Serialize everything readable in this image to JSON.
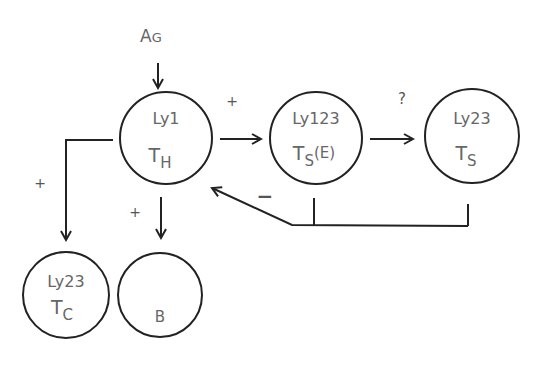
{
  "diagram": {
    "input": {
      "label": "AG",
      "label_main": "A",
      "label_small": "G"
    },
    "nodes": [
      {
        "id": "th",
        "line1": "Ly1",
        "line2_main": "T",
        "line2_sub": "H",
        "cx": 166,
        "cy": 138,
        "r": 46
      },
      {
        "id": "tse",
        "line1": "Ly123",
        "line2_main": "T",
        "line2_sub": "S",
        "line2_suffix": "(E)",
        "cx": 316,
        "cy": 138,
        "r": 46
      },
      {
        "id": "ts",
        "line1": "Ly23",
        "line2_main": "T",
        "line2_sub": "S",
        "cx": 472,
        "cy": 136,
        "r": 47
      },
      {
        "id": "tc",
        "line1": "Ly23",
        "line2_main": "T",
        "line2_sub": "C",
        "cx": 66,
        "cy": 295,
        "r": 43
      },
      {
        "id": "b",
        "line1": "",
        "line2_main": "B",
        "cx": 160,
        "cy": 295,
        "r": 42
      }
    ],
    "edges": [
      {
        "from": "AG",
        "to": "th",
        "sign": ""
      },
      {
        "from": "th",
        "to": "tse",
        "sign": "+"
      },
      {
        "from": "tse",
        "to": "ts",
        "sign": "?"
      },
      {
        "from": "th",
        "to": "tc",
        "sign": "+"
      },
      {
        "from": "th",
        "to": "b",
        "sign": "+"
      },
      {
        "from": "tse+ts",
        "to": "th",
        "sign": "−"
      }
    ],
    "signs": {
      "th_to_tse": "+",
      "tse_to_ts": "?",
      "th_to_tc": "+",
      "th_to_b": "+",
      "feedback": "−"
    },
    "colors": {
      "stroke": "#222222",
      "text": "#666666"
    }
  }
}
